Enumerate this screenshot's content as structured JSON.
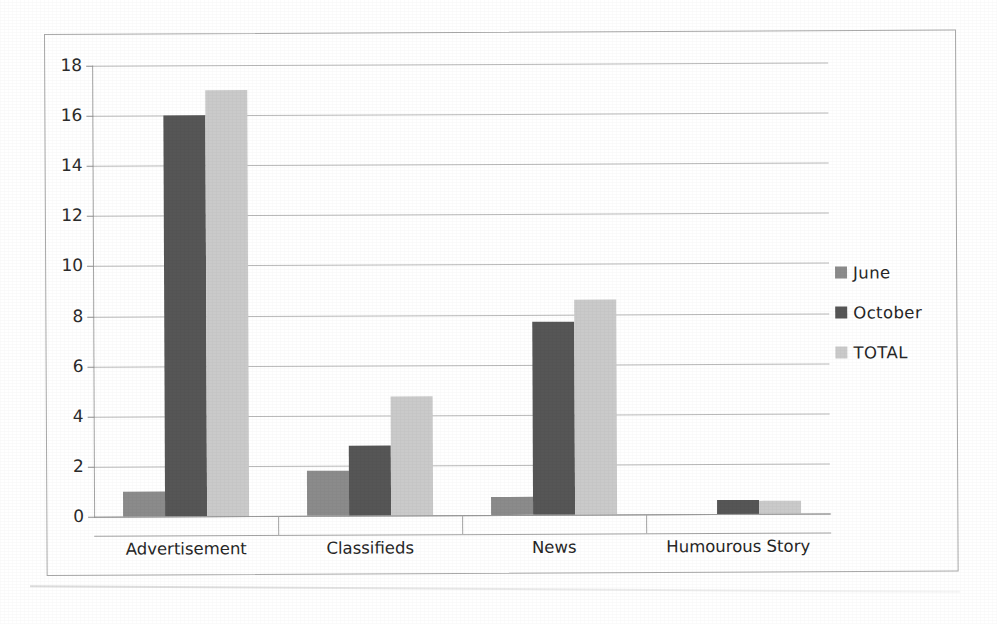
{
  "chart_data": {
    "type": "bar",
    "title": "",
    "subtitle": "",
    "xlabel": "",
    "ylabel": "",
    "categories": [
      "Advertisement",
      "Classifieds",
      "News",
      "Humourous Story"
    ],
    "series": [
      {
        "name": "June",
        "color": "#8b8b8b",
        "values": [
          1.0,
          1.8,
          0.7,
          0
        ]
      },
      {
        "name": "October",
        "color": "#565656",
        "values": [
          16.0,
          2.8,
          7.7,
          0.55
        ]
      },
      {
        "name": "TOTAL",
        "color": "#cacaca",
        "values": [
          17.0,
          4.75,
          8.6,
          0.5
        ]
      }
    ],
    "ylim": [
      0,
      18
    ],
    "ytick_step": 2,
    "ytick_labels": [
      "0",
      "2",
      "4",
      "6",
      "8",
      "10",
      "12",
      "14",
      "16",
      "18"
    ],
    "grid": true,
    "grid_axis": "y",
    "legend_position": "right",
    "orientation": "vertical",
    "bar_grouping": "grouped"
  },
  "legend": {
    "entries": [
      {
        "label": "June",
        "swatch": "june-swatch"
      },
      {
        "label": "October",
        "swatch": "october-swatch"
      },
      {
        "label": "TOTAL",
        "swatch": "total-swatch"
      }
    ]
  },
  "frame": {
    "border_color": "#a9a9a9",
    "background": "#ffffff"
  }
}
